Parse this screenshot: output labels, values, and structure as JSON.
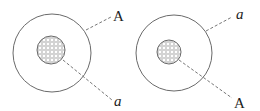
{
  "diagram": {
    "figures": [
      {
        "id": "left",
        "outer_circle": {
          "cx": 52,
          "cy": 53,
          "r": 39
        },
        "inner_circle": {
          "cx": 51,
          "cy": 50,
          "r": 14,
          "fill": "dotted-hatch"
        },
        "labels": [
          {
            "text": "A",
            "italic": false,
            "points_to": "outer_circle",
            "x": 113,
            "y": 21
          },
          {
            "text": "a",
            "italic": true,
            "points_to": "inner_circle",
            "x": 114,
            "y": 106
          }
        ]
      },
      {
        "id": "right",
        "outer_circle": {
          "cx": 174,
          "cy": 53,
          "r": 38
        },
        "inner_circle": {
          "cx": 169,
          "cy": 52,
          "r": 12,
          "fill": "dotted-hatch"
        },
        "labels": [
          {
            "text": "a",
            "italic": true,
            "points_to": "outer_circle",
            "x": 236,
            "y": 19
          },
          {
            "text": "A",
            "italic": false,
            "points_to": "inner_circle",
            "x": 234,
            "y": 108
          }
        ]
      }
    ],
    "colors": {
      "stroke": "#6a6a6a",
      "dash": "#777777",
      "text": "#222222",
      "dot": "#9a9a9a"
    }
  }
}
